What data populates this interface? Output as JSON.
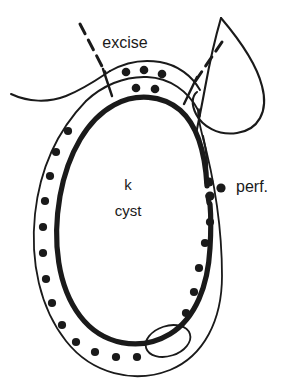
{
  "figure": {
    "type": "medical-line-drawing",
    "background_color": "#ffffff",
    "ink_color": "#1a1a1a"
  },
  "labels": {
    "excise": "excise",
    "perf": "perf.",
    "organ_initial": "k",
    "organ_structure": "cyst"
  },
  "annotations": {
    "excise_note": "excise",
    "perforation_note": "perf."
  },
  "elements": {
    "outer_capsule_name": "thin outer capsule outline",
    "inner_wall_name": "thick inner cyst wall",
    "dot_ring_name": "ring of dark dots between walls",
    "small_oval_name": "small oval inclusion at lower right",
    "right_loop_name": "adjacent looped structure at upper right",
    "left_tail_name": "left tissue tail",
    "dashed_left_name": "left dashed excision guide",
    "dashed_right_name": "right dashed excision guide"
  },
  "dot_ring": {
    "count": 26,
    "color": "#1a1a1a",
    "radius": 4.1
  },
  "cluster_dots": {
    "upper_row_count": 3,
    "lower_row_count": 2,
    "perf_cluster_count": 3
  },
  "caption_ghost": "a partially cropped caption line at the bottom edge"
}
